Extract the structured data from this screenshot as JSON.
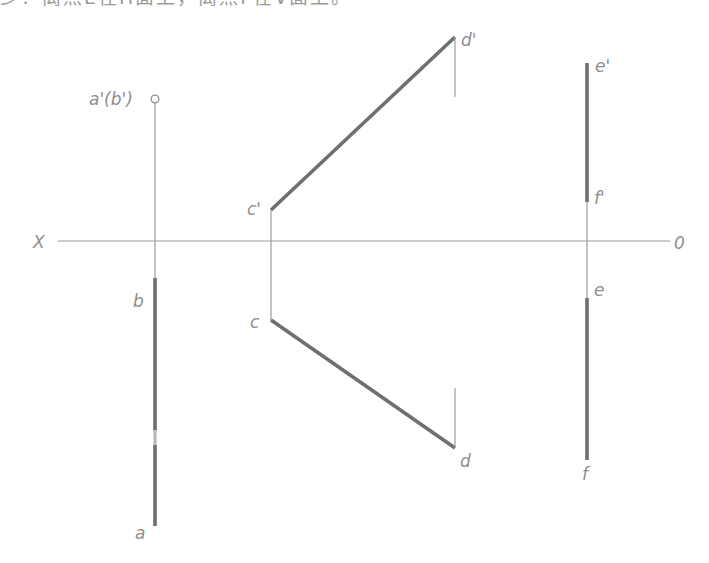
{
  "header": {
    "cropped_text": "少？离点E在H面上，离点F在V面上。"
  },
  "diagram": {
    "axis": {
      "left_label": "X",
      "right_label": "0",
      "y": 241,
      "x_start": 58,
      "x_end": 670
    },
    "colors": {
      "thin_line": "#9c9c9c",
      "thick_line": "#6f6f6f",
      "label": "#8e8e8e"
    },
    "labels": {
      "ab_prime": "a'(b')",
      "b": "b",
      "a": "a",
      "c_prime": "c'",
      "c": "c",
      "d_prime": "d'",
      "d": "d",
      "e_prime": "e'",
      "f_prime": "f'",
      "e": "e",
      "f": "f"
    },
    "points": {
      "ab_prime": [
        155,
        99
      ],
      "b": [
        155,
        278
      ],
      "a": [
        155,
        526
      ],
      "c_prime": [
        271,
        210
      ],
      "c": [
        271,
        320
      ],
      "d_prime": [
        455,
        37
      ],
      "d": [
        455,
        448
      ],
      "e_prime": [
        587,
        63
      ],
      "f_prime": [
        587,
        202
      ],
      "e": [
        587,
        298
      ],
      "f": [
        587,
        460
      ]
    }
  }
}
